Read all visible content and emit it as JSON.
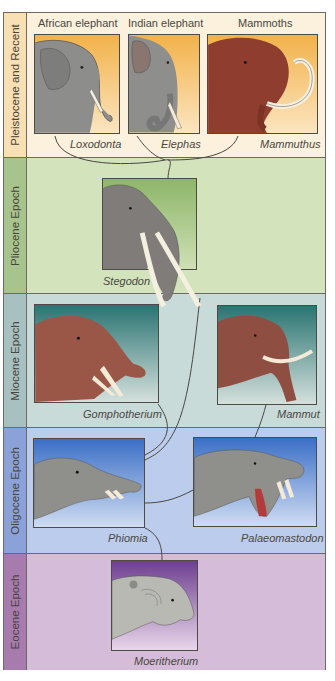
{
  "epochs": [
    {
      "label": "Pleistocene and Recent",
      "bg": "#fbf1dd",
      "label_bg": "#f8dfb4"
    },
    {
      "label": "Pliocene Epoch",
      "bg": "#d3e4bd",
      "label_bg": "#a8c48d"
    },
    {
      "label": "Miocene Epoch",
      "bg": "#c9dbd9",
      "label_bg": "#a6c1bf"
    },
    {
      "label": "Oligocene Epoch",
      "bg": "#bcccec",
      "label_bg": "#8aa2d8"
    },
    {
      "label": "Eocene Epoch",
      "bg": "#d5bcd9",
      "label_bg": "#a77bae"
    }
  ],
  "common_names": {
    "african": "African elephant",
    "indian": "Indian elephant",
    "mammoths": "Mammoths"
  },
  "genera": {
    "loxodonta": "Loxodonta",
    "elephas": "Elephas",
    "mammuthus": "Mammuthus",
    "stegodon": "Stegodon",
    "gomphotherium": "Gomphotherium",
    "mammut": "Mammut",
    "phiomia": "Phiomia",
    "palaeomastodon": "Palaeomastodon",
    "moeritherium": "Moeritherium"
  },
  "icons": {
    "african": "african-elephant-head-icon",
    "indian": "indian-elephant-head-icon",
    "mammoth": "mammoth-head-icon",
    "stegodon": "stegodon-head-icon",
    "gomphotherium": "gomphotherium-head-icon",
    "mammut": "mammut-head-icon",
    "phiomia": "phiomia-head-icon",
    "palaeomastodon": "palaeomastodon-head-icon",
    "moeritherium": "moeritherium-head-icon"
  }
}
